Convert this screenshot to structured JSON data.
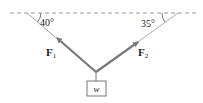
{
  "diagram": {
    "ceiling": {
      "style": "dashed",
      "color": "#888888"
    },
    "angles": {
      "left": "40°",
      "right": "35°"
    },
    "forces": {
      "f1": {
        "symbol": "F",
        "subscript": "1"
      },
      "f2": {
        "symbol": "F",
        "subscript": "2"
      }
    },
    "weight": {
      "label": "w"
    },
    "colors": {
      "rope": "#aaaaaa",
      "arrow": "#7a7a7a",
      "text": "#222222"
    }
  }
}
